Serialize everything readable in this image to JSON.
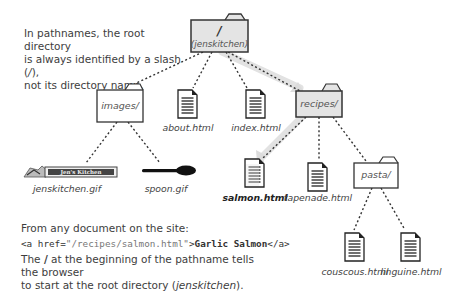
{
  "notes": {
    "top": {
      "line1": "In pathnames, the root directory",
      "line2_prefix": "is always identified by a slash (",
      "line2_em": "/",
      "line2_suffix": "),",
      "line3": "not its directory name."
    },
    "from": "From any document on the site:",
    "code": {
      "open": "<a href=",
      "value": "\"/recipes/salmon.html\"",
      "close_open": ">",
      "text": "Garlic Salmon",
      "end": "</a>"
    },
    "bottom": {
      "prefix": "The ",
      "slash": "/",
      "middle": " at the beginning of the pathname tells the browser",
      "line2_prefix": "to start at the root directory (",
      "line2_em": "jenskitchen",
      "line2_suffix": ")."
    }
  },
  "tree": {
    "root": {
      "label_main": "/",
      "label_sub": "(jenskitchen)",
      "highlighted": true
    },
    "folders": [
      {
        "id": "images",
        "label": "images/",
        "highlighted": false
      },
      {
        "id": "recipes",
        "label": "recipes/",
        "highlighted": true
      },
      {
        "id": "pasta",
        "label": "pasta/",
        "highlighted": false
      }
    ],
    "files": [
      {
        "id": "about",
        "label": "about.html",
        "type": "document"
      },
      {
        "id": "index",
        "label": "index.html",
        "type": "document"
      },
      {
        "id": "jenskitchen",
        "label": "jenskitchen.gif",
        "type": "image",
        "image_text": "Jen's Kitchen"
      },
      {
        "id": "spoon",
        "label": "spoon.gif",
        "type": "image"
      },
      {
        "id": "salmon",
        "label": "salmon.html",
        "type": "document",
        "highlighted": true
      },
      {
        "id": "tapenade",
        "label": "tapenade.html",
        "type": "document"
      },
      {
        "id": "couscous",
        "label": "couscous.html",
        "type": "document"
      },
      {
        "id": "linguine",
        "label": "linguine.html",
        "type": "document"
      }
    ]
  },
  "colors": {
    "highlight_fill": "#e4e4e4",
    "highlight_path": "#e0e0e0",
    "stroke": "#333333",
    "text": "#444444"
  }
}
